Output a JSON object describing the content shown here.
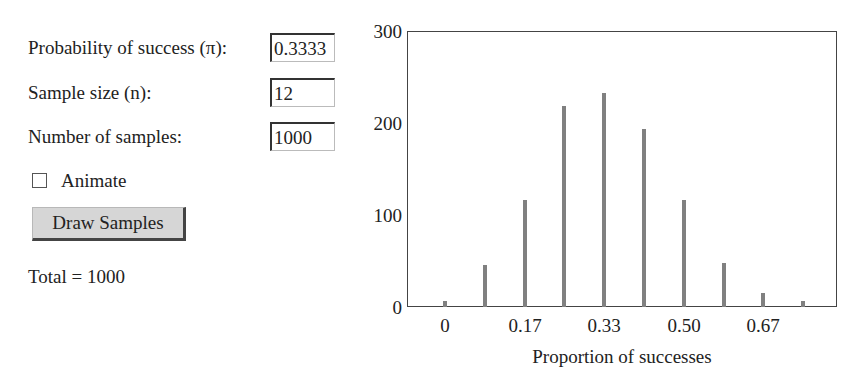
{
  "controls": {
    "probability_label": "Probability of success (π):",
    "probability_value": "0.3333",
    "sample_size_label": "Sample size (n):",
    "sample_size_value": "12",
    "num_samples_label": "Number of samples:",
    "num_samples_value": "1000",
    "animate_label": "Animate",
    "animate_checked": false,
    "draw_button_label": "Draw Samples",
    "total_text": "Total = 1000"
  },
  "chart_data": {
    "type": "bar",
    "title": "",
    "xlabel": "Proportion of successes",
    "ylabel": "",
    "ylim": [
      0,
      300
    ],
    "yticks": [
      "0",
      "100",
      "200",
      "300"
    ],
    "xtick_labels": [
      "0",
      "0.17",
      "0.33",
      "0.50",
      "0.67"
    ],
    "categories": [
      "0",
      "0.083",
      "0.17",
      "0.25",
      "0.33",
      "0.42",
      "0.50",
      "0.58",
      "0.67",
      "0.75",
      "0.83",
      "0.92",
      "1.00"
    ],
    "values": [
      7,
      46,
      116,
      218,
      233,
      194,
      116,
      48,
      15,
      7,
      0,
      0,
      0
    ],
    "bar_color": "#808080",
    "grid": false,
    "legend": null
  }
}
